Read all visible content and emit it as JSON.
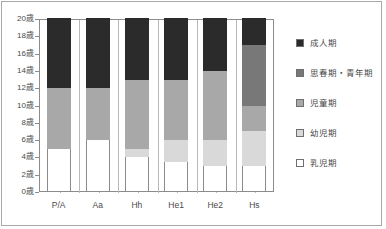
{
  "chart_data": {
    "type": "bar",
    "title": "",
    "subtitle": "",
    "xlabel": "",
    "ylabel": "",
    "stacked": true,
    "orientation": "vertical",
    "grid": false,
    "legend_position": "right",
    "ylim": [
      0,
      20
    ],
    "ytick_step": 2,
    "y_unit": "歳",
    "ytick_labels": [
      "0歳",
      "2歳",
      "4歳",
      "6歳",
      "8歳",
      "10歳",
      "12歳",
      "14歳",
      "16歳",
      "18歳",
      "20歳"
    ],
    "ytick_values": [
      0,
      2,
      4,
      6,
      8,
      10,
      12,
      14,
      16,
      18,
      20
    ],
    "categories": [
      "P/A",
      "Aa",
      "Hh",
      "He1",
      "He2",
      "Hs"
    ],
    "series": [
      {
        "name": "乳児期",
        "color": "#ffffff",
        "values": [
          5,
          6,
          4,
          3.5,
          3,
          3
        ]
      },
      {
        "name": "幼児期",
        "color": "#d9d9d9",
        "values": [
          0,
          0,
          1,
          2.5,
          3,
          4
        ]
      },
      {
        "name": "児童期",
        "color": "#a8a8a8",
        "values": [
          7,
          6,
          8,
          7,
          8,
          3
        ]
      },
      {
        "name": "思春期・青年期",
        "color": "#787878",
        "values": [
          0,
          0,
          0,
          0,
          0,
          7
        ]
      },
      {
        "name": "成人期",
        "color": "#2b2b2b",
        "values": [
          8,
          8,
          7,
          7,
          6,
          3
        ]
      }
    ],
    "segment_boundaries": {
      "P/A": [
        0,
        5,
        5,
        12,
        12,
        20
      ],
      "Aa": [
        0,
        6,
        6,
        12,
        12,
        20
      ],
      "Hh": [
        0,
        4,
        5,
        13,
        13,
        20
      ],
      "He1": [
        0,
        3.5,
        6,
        13,
        13,
        20
      ],
      "He2": [
        0,
        3,
        6,
        14,
        14,
        20
      ],
      "Hs": [
        0,
        3,
        7,
        10,
        17,
        20
      ]
    }
  },
  "legend": {
    "items": [
      {
        "label": "成人期",
        "color": "#2b2b2b"
      },
      {
        "label": "思春期・青年期",
        "color": "#787878"
      },
      {
        "label": "児童期",
        "color": "#a8a8a8"
      },
      {
        "label": "幼児期",
        "color": "#d9d9d9"
      },
      {
        "label": "乳児期",
        "color": "#ffffff"
      }
    ]
  }
}
